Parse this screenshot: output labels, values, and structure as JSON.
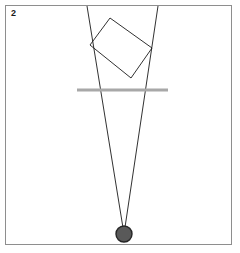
{
  "panel": {
    "label": "2",
    "background_color": "#ffffff",
    "frame_color": "#8e8e8e",
    "frame": {
      "x": 5,
      "y": 5,
      "width": 227,
      "height": 240
    }
  },
  "diagram": {
    "kind": "ray-optics-reflection-sketch",
    "stroke_color": "#1a1a1a",
    "stroke_width": 0.9,
    "rays": {
      "name": "converging-ray-pair",
      "apex": {
        "x": 124,
        "y": 234
      },
      "left_top": {
        "x": 87,
        "y": 6
      },
      "right_top": {
        "x": 158,
        "y": 6
      }
    },
    "rectangle": {
      "name": "tilted-rectangle",
      "corners": [
        {
          "x": 110,
          "y": 18
        },
        {
          "x": 152,
          "y": 48
        },
        {
          "x": 131,
          "y": 78
        },
        {
          "x": 90,
          "y": 45
        }
      ],
      "fill": "none"
    },
    "axis_line": {
      "name": "gray-horizontal-axis",
      "x1": 77,
      "x2": 168,
      "y": 90,
      "color": "#a8a8a8",
      "thickness": 3
    },
    "source_point": {
      "name": "source-disc",
      "cx": 124,
      "cy": 234,
      "r": 8,
      "fill": "#595959",
      "stroke": "#262626",
      "stroke_width": 1.4
    }
  }
}
